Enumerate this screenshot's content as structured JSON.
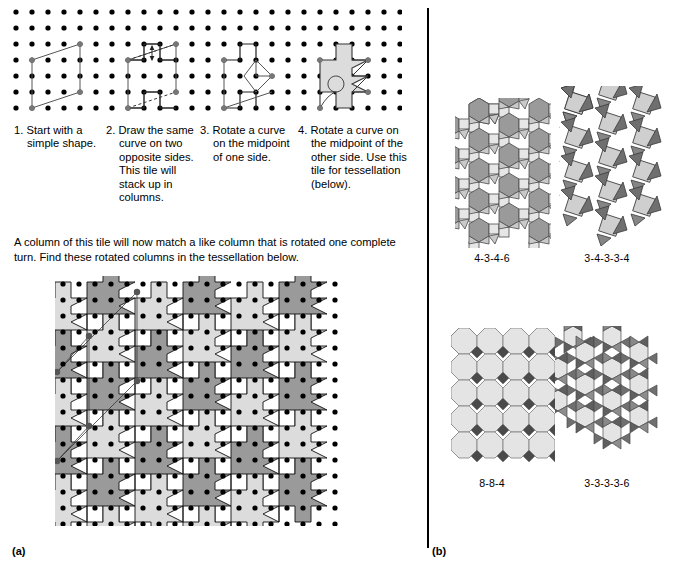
{
  "figure": {
    "panel_a_label": "(a)",
    "panel_b_label": "(b)"
  },
  "steps": [
    {
      "num": "1.",
      "text": "Start with a simple shape."
    },
    {
      "num": "2.",
      "text": "Draw the same curve on two opposite sides. This tile will stack up in columns."
    },
    {
      "num": "3.",
      "text": "Rotate a curve on the midpoint of one side."
    },
    {
      "num": "4.",
      "text": "Rotate a curve on the midpoint of the other side. Use this tile for tessellation (below)."
    }
  ],
  "intro": {
    "text": "A column of this tile will now match a like column that is rotated one complete turn. Find these rotated columns in the tessellation below."
  },
  "tessellations": [
    {
      "id": "fig-4-3-4-6",
      "caption": "4-3-4-6"
    },
    {
      "id": "fig-3-4-3-3-4",
      "caption": "3-4-3-3-4"
    },
    {
      "id": "fig-8-8-4",
      "caption": "8-8-4"
    },
    {
      "id": "fig-3-3-3-3-6",
      "caption": "3-3-3-3-6"
    }
  ],
  "colors": {
    "ink": "#000000",
    "light_gray": "#e2e2e2",
    "mid_gray": "#b9b9b9",
    "dark_gray": "#8f8f8f",
    "darker_gray": "#6f6f6f",
    "tile_light": "#dcdcdc",
    "tile_dark": "#9a9a9a",
    "page_bg": "#ffffff"
  }
}
